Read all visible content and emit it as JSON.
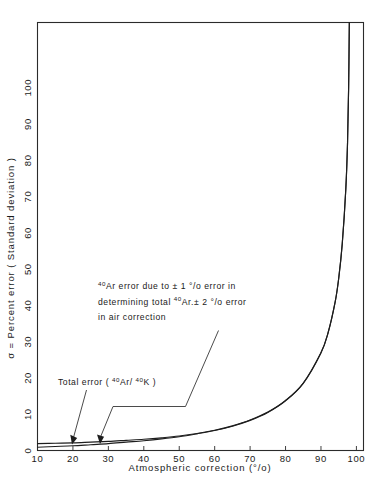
{
  "chart_data": {
    "type": "line",
    "title": "",
    "xlabel": "Atmospheric correction (°/o)",
    "ylabel": "σ = Percent error ( Standard deviation )",
    "xlim": [
      10,
      102
    ],
    "ylim": [
      0,
      118
    ],
    "grid": false,
    "legend": "none",
    "xticks": [
      10,
      20,
      30,
      40,
      50,
      60,
      70,
      80,
      90,
      100
    ],
    "xticklabels": [
      "10",
      "20",
      "30",
      "40",
      "50",
      "60",
      "70",
      "80",
      "90",
      "100"
    ],
    "yticks": [
      0,
      10,
      20,
      30,
      40,
      50,
      60,
      70,
      80,
      90,
      100
    ],
    "yticklabels": [
      "0",
      "10",
      "20",
      "30",
      "40",
      "50",
      "60",
      "70",
      "80",
      "90",
      "100"
    ],
    "x": [
      10,
      15,
      20,
      25,
      30,
      35,
      40,
      45,
      50,
      55,
      60,
      65,
      70,
      75,
      80,
      85,
      90,
      92,
      94,
      95,
      96,
      97,
      97.5,
      97.8,
      98
    ],
    "series": [
      {
        "name": "Total error (40Ar/40K)",
        "values": [
          1.9,
          2.0,
          2.1,
          2.3,
          2.5,
          2.8,
          3.1,
          3.5,
          4.0,
          4.7,
          5.6,
          6.8,
          8.4,
          10.6,
          13.8,
          18.6,
          27.0,
          32.5,
          41.0,
          47.5,
          57.0,
          72.0,
          85.0,
          100.0,
          118.0
        ]
      },
      {
        "name": "40Ar error due to air correction",
        "values": [
          0.9,
          1.1,
          1.3,
          1.6,
          1.9,
          2.3,
          2.7,
          3.2,
          3.8,
          4.6,
          5.5,
          6.7,
          8.3,
          10.5,
          13.7,
          18.5,
          26.9,
          32.4,
          40.9,
          47.4,
          56.9,
          71.9,
          84.9,
          99.9,
          117.9
        ]
      }
    ],
    "annotations": [
      {
        "id": "ar-error-note",
        "lines": [
          {
            "parts": [
              {
                "t": "40",
                "sup": true
              },
              {
                "t": "Ar error due to ± 1 °/o error in",
                "sup": false
              }
            ]
          },
          {
            "parts": [
              {
                "t": "determining total ",
                "sup": false
              },
              {
                "t": "40",
                "sup": true
              },
              {
                "t": "Ar.± 2 °/o error",
                "sup": false
              }
            ]
          },
          {
            "parts": [
              {
                "t": "in air correction",
                "sup": false
              }
            ]
          }
        ]
      },
      {
        "id": "total-error-note",
        "lines": [
          {
            "parts": [
              {
                "t": "Total  error  ( ",
                "sup": false
              },
              {
                "t": "40",
                "sup": true
              },
              {
                "t": "Ar/ ",
                "sup": false
              },
              {
                "t": "40",
                "sup": true
              },
              {
                "t": "K )",
                "sup": false
              }
            ]
          }
        ]
      }
    ]
  },
  "colors": {
    "ink": "#1a1a1a",
    "frame": "#2b2b2b",
    "curve": "#1d1d1d",
    "background": "#ffffff"
  }
}
